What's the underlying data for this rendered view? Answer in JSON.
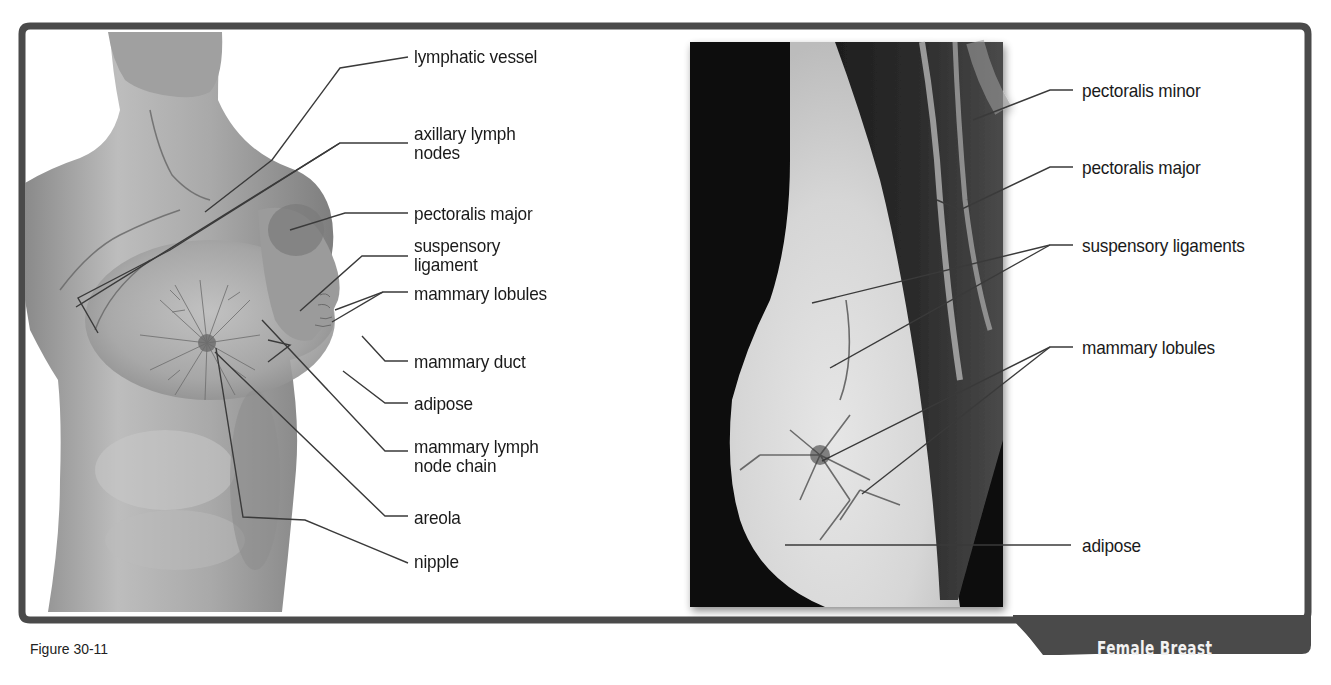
{
  "figure": {
    "caption": "Figure 30-11",
    "title": "Female Breast"
  },
  "colors": {
    "frame": "#4a4a4a",
    "title_tab_bg": "#4a4a4a",
    "title_text": "#f2f2f2",
    "label_text": "#1a1a1a",
    "leader_line": "#3a3a3a",
    "background": "#ffffff"
  },
  "left_panel": {
    "description": "3D illustration of female torso with breast anatomy",
    "labels": [
      {
        "id": "lymphatic-vessel",
        "text": "lymphatic vessel"
      },
      {
        "id": "axillary-lymph-nodes",
        "text": "axillary lymph\nnodes"
      },
      {
        "id": "pectoralis-major",
        "text": "pectoralis major"
      },
      {
        "id": "suspensory-ligament",
        "text": "suspensory\nligament"
      },
      {
        "id": "mammary-lobules",
        "text": "mammary lobules"
      },
      {
        "id": "mammary-duct",
        "text": "mammary duct"
      },
      {
        "id": "adipose",
        "text": "adipose"
      },
      {
        "id": "mammary-lymph-node-chain",
        "text": "mammary lymph\nnode chain"
      },
      {
        "id": "areola",
        "text": "areola"
      },
      {
        "id": "nipple",
        "text": "nipple"
      }
    ]
  },
  "right_panel": {
    "description": "Sagittal MRI-style cross-section of breast",
    "labels": [
      {
        "id": "pectoralis-minor",
        "text": "pectoralis minor"
      },
      {
        "id": "pectoralis-major",
        "text": "pectoralis major"
      },
      {
        "id": "suspensory-ligaments",
        "text": "suspensory ligaments"
      },
      {
        "id": "mammary-lobules",
        "text": "mammary lobules"
      },
      {
        "id": "adipose",
        "text": "adipose"
      }
    ]
  }
}
